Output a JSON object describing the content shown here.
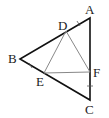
{
  "diagram": {
    "type": "geometry",
    "points": {
      "A": {
        "label": "A",
        "x": 90,
        "y": 18
      },
      "B": {
        "label": "B",
        "x": 20,
        "y": 59
      },
      "C": {
        "label": "C",
        "x": 90,
        "y": 100
      },
      "D": {
        "label": "D",
        "x": 66,
        "y": 31
      },
      "E": {
        "label": "E",
        "x": 44,
        "y": 73
      },
      "F": {
        "label": "F",
        "x": 90,
        "y": 72
      }
    },
    "outer_triangle": [
      "A",
      "B",
      "C"
    ],
    "inner_triangle": [
      "D",
      "E",
      "F"
    ],
    "extra_segments": [
      [
        "E",
        "F"
      ]
    ],
    "tick_marks": [
      "AD",
      "BE",
      "CF"
    ],
    "colors": {
      "outer": "#111111",
      "inner": "#888888"
    }
  }
}
